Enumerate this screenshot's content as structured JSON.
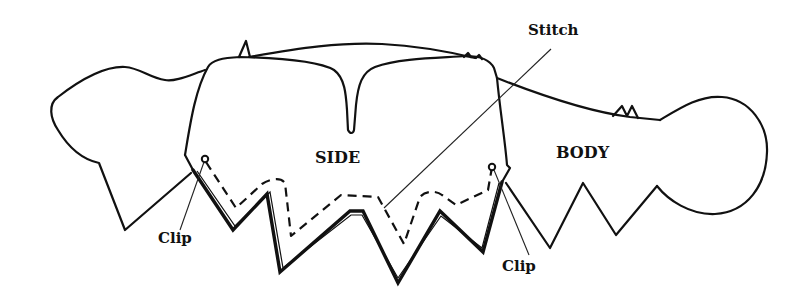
{
  "diagram": {
    "type": "sewing-pattern-illustration",
    "pieces": [
      {
        "id": "side",
        "label": "SIDE"
      },
      {
        "id": "body",
        "label": "BODY"
      }
    ],
    "annotations": {
      "stitch": "Stitch",
      "clip_left": "Clip",
      "clip_right": "Clip"
    },
    "colors": {
      "line": "#111111",
      "background": "#ffffff"
    }
  }
}
